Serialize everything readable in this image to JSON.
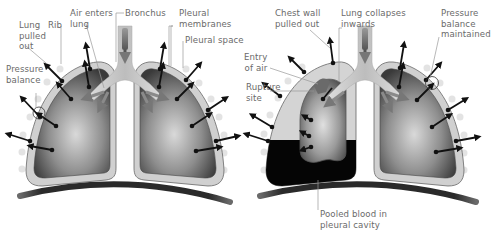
{
  "diagram": {
    "panels": [
      {
        "id": "normal",
        "labels": {
          "lung_pulled_out": "Lung\npulled\nout",
          "rib": "Rib",
          "air_enters_lung": "Air enters\nlung",
          "bronchus": "Bronchus",
          "pleural_membranes": "Pleural\nmembranes",
          "pleural_space": "Pleural space",
          "pressure_balance": "Pressure\nbalance"
        }
      },
      {
        "id": "collapsed",
        "labels": {
          "chest_wall_pulled_out": "Chest wall\npulled out",
          "lung_collapses_inwards": "Lung collapses\ninwards",
          "pressure_balance_maintained": "Pressure\nbalance\nmaintained",
          "entry_of_air": "Entry\nof air",
          "rupture_site": "Rupture\nsite",
          "pooled_blood": "Pooled blood in\npleural cavity"
        }
      }
    ],
    "colors": {
      "label_text": "#6a6a6a",
      "leader_line": "#9a9a9a",
      "lung_dark": "#3c3c3c",
      "lung_light": "#d8d8d8",
      "pleura": "#cfcfcf",
      "pleura_outline": "#6b6b6b",
      "blood": "#050505",
      "arrow": "#111111",
      "diaphragm": "#2e2e2e",
      "rib_dot": "#e2e2e2",
      "bronchus": "#c4c4c4"
    }
  }
}
